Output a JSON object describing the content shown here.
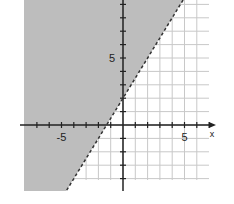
{
  "chart_data": {
    "type": "inequality-graph",
    "title": "",
    "xlabel": "x",
    "ylabel": "",
    "xlim": [
      -8,
      7
    ],
    "ylim": [
      -5,
      9.3
    ],
    "grid": true,
    "boundary": {
      "slope": 1.5,
      "intercept": 2,
      "style": "dashed",
      "equation": "y = 1.5x + 2"
    },
    "shaded_region": "above-left",
    "inequality": "y > 1.5x + 2",
    "x_tick_labels": [
      {
        "value": -5,
        "label": "-5"
      },
      {
        "value": 5,
        "label": "5"
      }
    ],
    "y_tick_labels": [
      {
        "value": 5,
        "label": "5"
      }
    ],
    "colors": {
      "shade": "#bdbdbd",
      "grid": "#c8c8c8",
      "axis": "#222222",
      "boundary": "#333333"
    }
  }
}
